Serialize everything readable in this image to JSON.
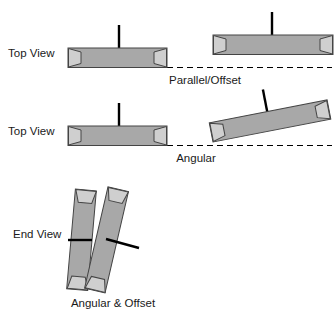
{
  "figure": {
    "background_color": "#ffffff",
    "width": 335,
    "height": 317
  },
  "colors": {
    "shaft_fill": "#a8a8a8",
    "cap_fill": "#cfcfcf",
    "outline": "#444444",
    "stem": "#000000",
    "text": "#1a1a1a",
    "dashed_line": "#000000"
  },
  "sections": [
    {
      "id": "parallel-offset",
      "view_label": "Top View",
      "caption": "Parallel/Offset",
      "shafts": [
        {
          "id": "left-shaft",
          "role": "stationary",
          "angle_deg": 0
        },
        {
          "id": "right-shaft",
          "role": "offset",
          "angle_deg": 0,
          "offset": "vertical"
        }
      ]
    },
    {
      "id": "angular",
      "view_label": "Top View",
      "caption": "Angular",
      "shafts": [
        {
          "id": "left-shaft",
          "role": "stationary",
          "angle_deg": 0
        },
        {
          "id": "right-shaft",
          "role": "angled",
          "angle_deg": -11
        }
      ]
    },
    {
      "id": "angular-and-offset",
      "view_label": "End View",
      "caption": "Angular & Offset",
      "shafts": [
        {
          "id": "left-shaft",
          "role": "angled",
          "angle_deg": 5
        },
        {
          "id": "right-shaft",
          "role": "angled-offset",
          "angle_deg": 13
        }
      ]
    }
  ]
}
